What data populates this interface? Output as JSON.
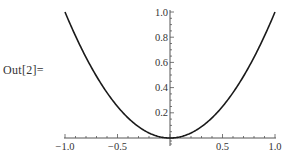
{
  "cell": {
    "out_label": "Out[2]="
  },
  "chart_data": {
    "type": "line",
    "title": "",
    "xlabel": "",
    "ylabel": "",
    "function": "x^2",
    "xlim": [
      -1.0,
      1.0
    ],
    "ylim": [
      0.0,
      1.0
    ],
    "grid": false,
    "legend": null,
    "x_ticks": [
      "-1.0",
      "-0.5",
      "0.5",
      "1.0"
    ],
    "y_ticks": [
      "0.2",
      "0.4",
      "0.6",
      "0.8",
      "1.0"
    ],
    "x": [
      -1.0,
      -0.9,
      -0.8,
      -0.7,
      -0.6,
      -0.5,
      -0.4,
      -0.3,
      -0.2,
      -0.1,
      0.0,
      0.1,
      0.2,
      0.3,
      0.4,
      0.5,
      0.6,
      0.7,
      0.8,
      0.9,
      1.0
    ],
    "series": [
      {
        "name": "x^2",
        "values": [
          1.0,
          0.81,
          0.64,
          0.49,
          0.36,
          0.25,
          0.16,
          0.09,
          0.04,
          0.01,
          0.0,
          0.01,
          0.04,
          0.09,
          0.16,
          0.25,
          0.36,
          0.49,
          0.64,
          0.81,
          1.0
        ]
      }
    ]
  },
  "style": {
    "curve_color": "#1a1a1a",
    "axis_color": "#555555",
    "label_color": "#333333"
  }
}
